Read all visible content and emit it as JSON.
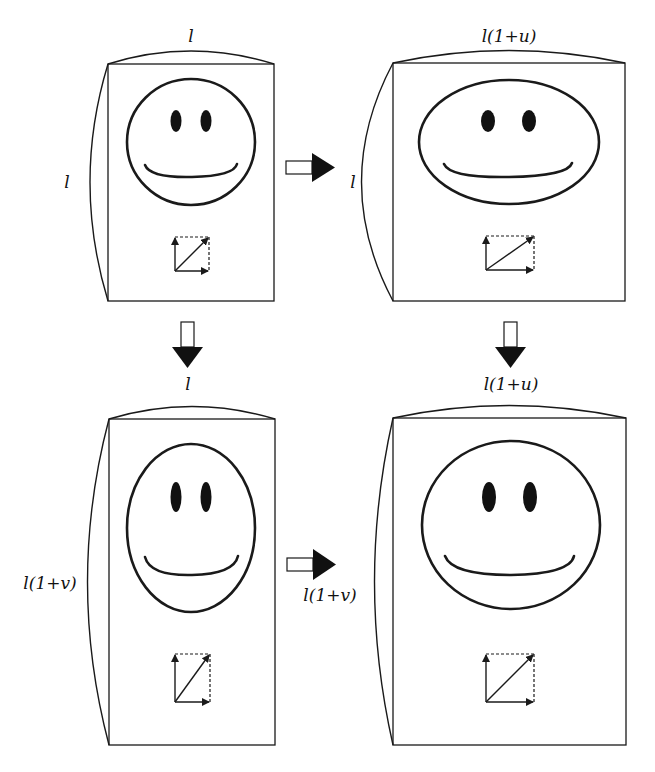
{
  "panels": [
    {
      "id": "original",
      "top_label": "l",
      "side_label": "l",
      "face": "circle"
    },
    {
      "id": "stretched-horizontal",
      "top_label": "l(1+u)",
      "side_label": "l",
      "face": "wide-ellipse"
    },
    {
      "id": "stretched-vertical",
      "top_label": "l",
      "side_label": "l(1+v)",
      "face": "tall-ellipse"
    },
    {
      "id": "stretched-both",
      "top_label": "l(1+u)",
      "side_label": "l(1+v)",
      "face": "circle"
    }
  ],
  "arrows": [
    {
      "from": "original",
      "to": "stretched-horizontal",
      "direction": "right"
    },
    {
      "from": "original",
      "to": "stretched-vertical",
      "direction": "down"
    },
    {
      "from": "stretched-horizontal",
      "to": "stretched-both",
      "direction": "down"
    },
    {
      "from": "stretched-vertical",
      "to": "stretched-both",
      "direction": "right"
    }
  ],
  "colors": {
    "ink": "#1a1a1a",
    "background": "#ffffff"
  }
}
